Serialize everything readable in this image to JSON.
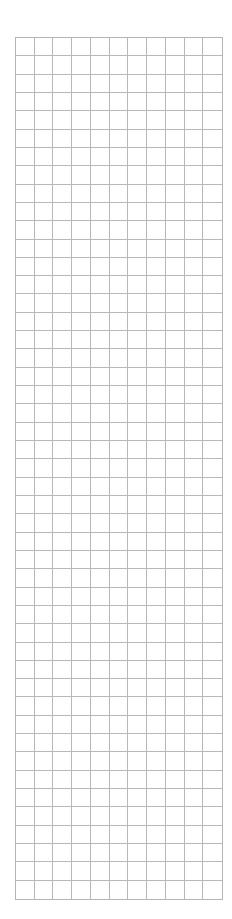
{
  "grid": {
    "columns": 11,
    "rows": 47,
    "line_color": "#b8b8b8",
    "background_color": "#ffffff",
    "cells_filled": []
  }
}
